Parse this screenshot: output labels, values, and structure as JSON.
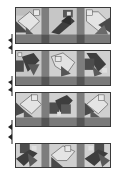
{
  "diagram": {
    "type": "quilt-row-assembly",
    "colors": {
      "light": "#d6d6d6",
      "medium": "#9a9a9a",
      "dark": "#4a4a4a",
      "sash": "#7d7d7d",
      "outline": "#3a3a3a"
    },
    "strips": [
      {
        "id": 1,
        "blocks": [
          "light-house",
          "dark-bird",
          "light-house"
        ],
        "has_bottom_sash": true
      },
      {
        "id": 2,
        "blocks": [
          "dark-bird",
          "light-house",
          "dark-bird"
        ],
        "has_bottom_sash": true
      },
      {
        "id": 3,
        "blocks": [
          "light-house",
          "dark-bird",
          "light-house"
        ],
        "has_bottom_sash": true
      },
      {
        "id": 4,
        "blocks": [
          "dark-bird",
          "light-house",
          "dark-bird"
        ],
        "has_bottom_sash": false
      }
    ],
    "markers": [
      "join-arrow",
      "join-arrow",
      "join-arrow"
    ]
  }
}
